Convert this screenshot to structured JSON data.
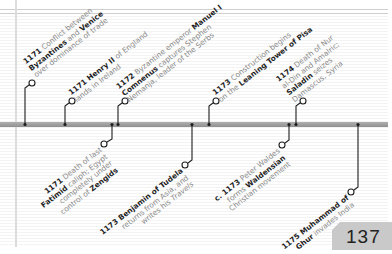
{
  "page": {
    "number": "137"
  },
  "colors": {
    "bar": "#9a9a9a",
    "text_regular": "#8a8a8a",
    "text_bold": "#1e1e1e",
    "page_box": "#c9c9c9"
  },
  "timeline": {
    "above": [
      {
        "year": "1171",
        "lines": [
          [
            "1171",
            " Conflict between"
          ],
          [
            "",
            "Byzantines",
            " and ",
            "Venice"
          ],
          [
            "",
            "over dominance of trade"
          ]
        ]
      },
      {
        "year": "1171",
        "lines": [
          [
            "1171",
            " ",
            "Henry II",
            " of England"
          ],
          [
            "",
            "lands in Ireland"
          ]
        ]
      },
      {
        "year": "1172",
        "lines": [
          [
            "1172",
            " Byzantine emperor ",
            "Manuel I"
          ],
          [
            "Comnenus",
            " captures Stephen"
          ],
          [
            "",
            "Nemanja, leader of the Serbs"
          ]
        ]
      },
      {
        "year": "1173",
        "lines": [
          [
            "1173",
            " Construction begins"
          ],
          [
            "",
            "on the ",
            "Leaning Tower of Pisa"
          ]
        ]
      },
      {
        "year": "1174",
        "lines": [
          [
            "1174",
            " Death of Nur"
          ],
          [
            "",
            "al-Din and Amalric;"
          ],
          [
            "Saladin",
            " seizes"
          ],
          [
            "",
            "Damascus, Syria"
          ]
        ]
      }
    ],
    "below": [
      {
        "year": "1171",
        "lines": [
          [
            "1171",
            " Death of last"
          ],
          [
            "Fatimid",
            " caliph; Egypt"
          ],
          [
            "",
            "completely under"
          ],
          [
            "",
            "control of ",
            "Zengids"
          ]
        ]
      },
      {
        "year": "1173",
        "lines": [
          [
            "1173 Benjamin of Tudela"
          ],
          [
            "",
            "returns from Asia, and"
          ],
          [
            "",
            "writes his ",
            "Travels"
          ]
        ]
      },
      {
        "year": "c. 1173",
        "lines": [
          [
            "c. 1173",
            " Peter Waldes"
          ],
          [
            "",
            "forms ",
            "Waldensian"
          ],
          [
            "",
            "Christian movement"
          ]
        ]
      },
      {
        "year": "1175",
        "lines": [
          [
            "1175 Muhammad of"
          ],
          [
            "Ghur",
            " invades India"
          ]
        ]
      }
    ]
  },
  "entries": {
    "a1": {
      "l1b": "1171",
      "l1": " Conflict between",
      "l2b": "Byzantines",
      "l2": " and ",
      "l2b2": "Venice",
      "l3": "over dominance of trade"
    },
    "a2": {
      "l1b": "1171 Henry II",
      "l1": " of England",
      "l2": "lands in Ireland"
    },
    "a3": {
      "l1b": "1172",
      "l1": " Byzantine emperor ",
      "l1b2": "Manuel I",
      "l2b": "Comnenus",
      "l2": " captures Stephen",
      "l3": "Nemanja, leader of the Serbs"
    },
    "a4": {
      "l1b": "1173",
      "l1": " Construction begins",
      "l2": "on the ",
      "l2b": "Leaning Tower of Pisa"
    },
    "a5": {
      "l1b": "1174",
      "l1": " Death of Nur",
      "l2": "al-Din and Amalric;",
      "l3b": "Saladin",
      "l3": " seizes",
      "l4": "Damascus, Syria"
    },
    "b1": {
      "l1b": "1171",
      "l1": " Death of last",
      "l2b": "Fatimid",
      "l2": " caliph; Egypt",
      "l3": "completely under",
      "l4": "control of ",
      "l4b": "Zengids"
    },
    "b2": {
      "l1b": "1173 Benjamin of Tudela",
      "l2": "returns from Asia, and",
      "l3": "writes his ",
      "l3i": "Travels"
    },
    "b3": {
      "l1b": "c. 1173",
      "l1": " Peter Waldes",
      "l2": "forms ",
      "l2b": "Waldensian",
      "l3": "Christian movement"
    },
    "b4": {
      "l1b": "1175 Muhammad of",
      "l2b": "Ghur",
      "l2": " invades India"
    }
  }
}
